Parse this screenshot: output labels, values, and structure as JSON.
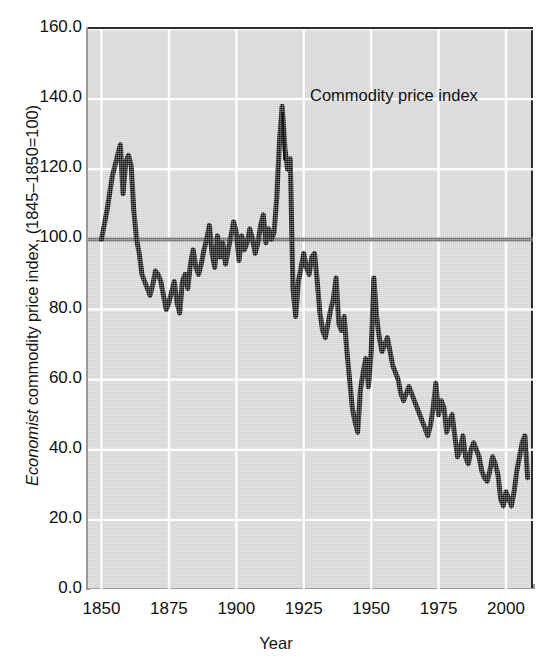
{
  "chart_data": {
    "type": "line",
    "title": "",
    "xlabel": "Year",
    "ylabel": "Economist commodity price index, (1845–1850=100)",
    "ylabel_italic_part": "Economist",
    "ylabel_rest": " commodity price index, (1845–1850=100)",
    "xlim": [
      1845,
      2010
    ],
    "ylim": [
      0,
      160
    ],
    "xticks": [
      1850,
      1875,
      1900,
      1925,
      1950,
      1975,
      2000
    ],
    "xtick_labels": [
      "1850",
      "1875",
      "1900",
      "1925",
      "1950",
      "1975",
      "2000"
    ],
    "yticks": [
      0,
      20,
      40,
      60,
      80,
      100,
      120,
      140,
      160
    ],
    "ytick_labels": [
      "0.0",
      "20.0",
      "40.0",
      "60.0",
      "80.0",
      "100.0",
      "120.0",
      "140.0",
      "160.0"
    ],
    "grid": true,
    "grid_color": "#ffffff",
    "plot_background": "#d3d3d3",
    "line_color": "#111111",
    "line_width": 5,
    "reference_line": {
      "value": 100,
      "color": "#6e6e6e",
      "width": 4
    },
    "legend": "none",
    "annotations": [
      {
        "text": "Commodity price index",
        "x": 1922,
        "y": 139,
        "points_to_x": 1917,
        "points_to_y": 122
      }
    ],
    "series": [
      {
        "name": "Commodity price index",
        "x": [
          1850,
          1851,
          1852,
          1853,
          1854,
          1855,
          1856,
          1857,
          1858,
          1859,
          1860,
          1861,
          1862,
          1863,
          1864,
          1865,
          1866,
          1867,
          1868,
          1869,
          1870,
          1871,
          1872,
          1873,
          1874,
          1875,
          1876,
          1877,
          1878,
          1879,
          1880,
          1881,
          1882,
          1883,
          1884,
          1885,
          1886,
          1887,
          1888,
          1889,
          1890,
          1891,
          1892,
          1893,
          1894,
          1895,
          1896,
          1897,
          1898,
          1899,
          1900,
          1901,
          1902,
          1903,
          1904,
          1905,
          1906,
          1907,
          1908,
          1909,
          1910,
          1911,
          1912,
          1913,
          1914,
          1915,
          1916,
          1917,
          1918,
          1919,
          1920,
          1921,
          1922,
          1923,
          1924,
          1925,
          1926,
          1927,
          1928,
          1929,
          1930,
          1931,
          1932,
          1933,
          1934,
          1935,
          1936,
          1937,
          1938,
          1939,
          1940,
          1941,
          1942,
          1943,
          1944,
          1945,
          1946,
          1947,
          1948,
          1949,
          1950,
          1951,
          1952,
          1953,
          1954,
          1955,
          1956,
          1957,
          1958,
          1959,
          1960,
          1961,
          1962,
          1963,
          1964,
          1965,
          1966,
          1967,
          1968,
          1969,
          1970,
          1971,
          1972,
          1973,
          1974,
          1975,
          1976,
          1977,
          1978,
          1979,
          1980,
          1981,
          1982,
          1983,
          1984,
          1985,
          1986,
          1987,
          1988,
          1989,
          1990,
          1991,
          1992,
          1993,
          1994,
          1995,
          1996,
          1997,
          1998,
          1999,
          2000,
          2001,
          2002,
          2003,
          2004,
          2005,
          2006,
          2007,
          2008
        ],
        "y": [
          100,
          104,
          108,
          113,
          118,
          121,
          124,
          127,
          113,
          122,
          124,
          121,
          108,
          100,
          96,
          90,
          88,
          86,
          84,
          87,
          91,
          90,
          88,
          84,
          80,
          82,
          85,
          88,
          82,
          79,
          88,
          90,
          86,
          93,
          97,
          92,
          90,
          93,
          97,
          100,
          104,
          96,
          92,
          101,
          95,
          99,
          93,
          97,
          101,
          105,
          102,
          94,
          101,
          97,
          99,
          103,
          100,
          96,
          99,
          104,
          107,
          99,
          103,
          100,
          102,
          112,
          128,
          138,
          126,
          120,
          123,
          86,
          78,
          88,
          92,
          96,
          92,
          90,
          95,
          96,
          88,
          79,
          74,
          72,
          76,
          80,
          83,
          89,
          76,
          74,
          78,
          68,
          60,
          52,
          48,
          45,
          57,
          62,
          66,
          58,
          68,
          89,
          78,
          72,
          68,
          70,
          72,
          68,
          64,
          62,
          60,
          56,
          54,
          56,
          58,
          56,
          54,
          52,
          50,
          48,
          46,
          44,
          47,
          52,
          59,
          50,
          54,
          52,
          45,
          48,
          50,
          44,
          38,
          40,
          44,
          38,
          36,
          40,
          42,
          40,
          38,
          34,
          32,
          31,
          34,
          38,
          36,
          33,
          26,
          24,
          28,
          26,
          24,
          28,
          34,
          38,
          42,
          44,
          32
        ]
      }
    ]
  },
  "axis": {
    "x_label": "Year",
    "y_label_italic": "Economist",
    "y_label_rest": " commodity price index, (1845–1850=100)"
  },
  "annotation": {
    "label": "Commodity price index"
  }
}
